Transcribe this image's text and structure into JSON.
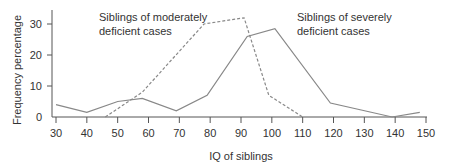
{
  "chart_data": {
    "type": "line",
    "title": "",
    "xlabel": "IQ of siblings",
    "ylabel": "Frequency percentage",
    "xlim": [
      30,
      150
    ],
    "ylim": [
      0,
      35
    ],
    "x_ticks": [
      30,
      40,
      50,
      60,
      70,
      80,
      90,
      100,
      110,
      120,
      130,
      140,
      150
    ],
    "y_ticks": [
      0,
      10,
      20,
      30
    ],
    "grid": false,
    "legend_position": "inline annotations",
    "series": [
      {
        "name": "Siblings of moderately deficient cases",
        "style": "dashed",
        "color": "#888888",
        "points": [
          [
            46,
            0
          ],
          [
            58,
            8
          ],
          [
            78,
            30
          ],
          [
            91,
            32
          ],
          [
            99,
            7
          ],
          [
            110,
            0
          ]
        ]
      },
      {
        "name": "Siblings of severely deficient cases",
        "style": "solid",
        "color": "#888888",
        "points": [
          [
            30,
            4
          ],
          [
            40,
            1.5
          ],
          [
            50,
            5
          ],
          [
            58,
            6
          ],
          [
            69,
            2
          ],
          [
            79,
            7
          ],
          [
            92,
            26
          ],
          [
            101,
            28.5
          ],
          [
            119,
            4.5
          ],
          [
            139,
            0
          ],
          [
            148,
            1.5
          ]
        ]
      }
    ],
    "annotations": [
      {
        "line1": "Siblings of moderately",
        "line2": "deficient cases"
      },
      {
        "line1": "Siblings of severely",
        "line2": "deficient cases"
      }
    ]
  }
}
